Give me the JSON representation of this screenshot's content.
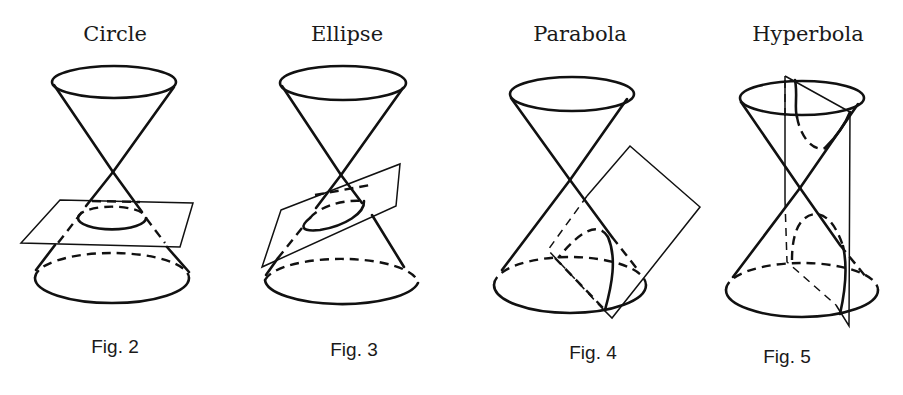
{
  "figures": [
    {
      "title": "Circle",
      "caption": "Fig. 2",
      "section": "circle"
    },
    {
      "title": "Ellipse",
      "caption": "Fig. 3",
      "section": "ellipse"
    },
    {
      "title": "Parabola",
      "caption": "Fig. 4",
      "section": "parabola"
    },
    {
      "title": "Hyperbola",
      "caption": "Fig. 5",
      "section": "hyperbola"
    }
  ],
  "colors": {
    "line": "#111111",
    "background": "#ffffff"
  }
}
